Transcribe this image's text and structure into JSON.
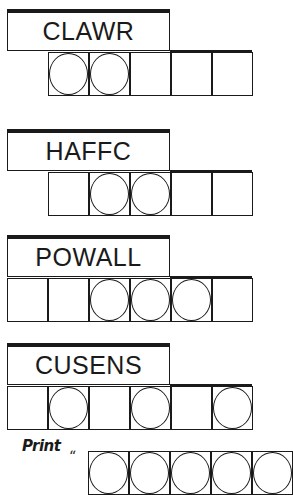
{
  "puzzle": {
    "jumbles": [
      {
        "scrambled": "CLAWR",
        "top": 9,
        "cells": 5,
        "cells_left": 48,
        "circled": [
          0,
          1
        ]
      },
      {
        "scrambled": "HAFFC",
        "top": 129,
        "cells": 5,
        "cells_left": 48,
        "circled": [
          1,
          2
        ]
      },
      {
        "scrambled": "POWALL",
        "top": 235,
        "cells": 6,
        "cells_left": 7,
        "circled": [
          2,
          3,
          4
        ]
      },
      {
        "scrambled": "CUSENS",
        "top": 343,
        "cells": 6,
        "cells_left": 7,
        "circled": [
          1,
          3,
          5
        ]
      }
    ],
    "answer_row": {
      "print_label": "Print",
      "quote_mark": "“",
      "visible_cells": 5
    }
  }
}
